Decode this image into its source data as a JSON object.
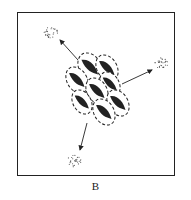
{
  "figure": {
    "panel_label": "B",
    "colors": {
      "ink": "#222222",
      "background": "#ffffff"
    },
    "cluster": {
      "cell_count": 8,
      "cells": [
        {
          "cx": 90,
          "cy": 67,
          "rx": 11,
          "ry": 15,
          "rot": -30
        },
        {
          "cx": 107,
          "cy": 68,
          "rx": 10,
          "ry": 14,
          "rot": -30
        },
        {
          "cx": 77,
          "cy": 80,
          "rx": 10,
          "ry": 14,
          "rot": -30
        },
        {
          "cx": 110,
          "cy": 84,
          "rx": 9,
          "ry": 13,
          "rot": -30
        },
        {
          "cx": 97,
          "cy": 91,
          "rx": 10,
          "ry": 14,
          "rot": -30
        },
        {
          "cx": 82,
          "cy": 102,
          "rx": 9,
          "ry": 13,
          "rot": -30
        },
        {
          "cx": 118,
          "cy": 103,
          "rx": 10,
          "ry": 14,
          "rot": -30
        },
        {
          "cx": 104,
          "cy": 112,
          "rx": 10,
          "ry": 14,
          "rot": -30
        }
      ]
    },
    "arrows": [
      {
        "name": "arrow-up-left",
        "x1": 78,
        "y1": 60,
        "x2": 60,
        "y2": 40
      },
      {
        "name": "arrow-right",
        "x1": 122,
        "y1": 84,
        "x2": 152,
        "y2": 70
      },
      {
        "name": "arrow-down-left",
        "x1": 87,
        "y1": 123,
        "x2": 80,
        "y2": 150
      }
    ],
    "clouds": [
      {
        "name": "cloud-top-left",
        "cx": 51,
        "cy": 32
      },
      {
        "name": "cloud-right",
        "cx": 161,
        "cy": 63
      },
      {
        "name": "cloud-bottom-left",
        "cx": 74,
        "cy": 161
      }
    ]
  }
}
